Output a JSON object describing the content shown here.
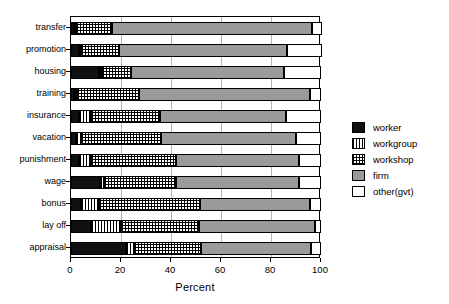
{
  "chart_data": {
    "type": "bar",
    "orientation": "horizontal",
    "stacked": true,
    "title": "",
    "xlabel": "Percent",
    "ylabel": "",
    "xlim": [
      0,
      100
    ],
    "xticks": [
      0,
      20,
      40,
      60,
      80,
      100
    ],
    "xtick_labels": [
      "0",
      "20",
      "40",
      "60",
      "80",
      "100"
    ],
    "grid": "vertical",
    "legend_position": "right",
    "categories": [
      "transfer",
      "promotion",
      "housing",
      "training",
      "insurance",
      "vacation",
      "punishment",
      "wage",
      "bonus",
      "lay off",
      "appraisal"
    ],
    "series": [
      {
        "name": "worker",
        "fill": "solid-black",
        "color": "#111111",
        "values": [
          1.2,
          3.0,
          11.0,
          1.0,
          3.0,
          2.0,
          3.0,
          11.5,
          4.0,
          8.0,
          22.0
        ]
      },
      {
        "name": "workgroup",
        "fill": "vertical-lines",
        "color": "#ffffff",
        "values": [
          0.5,
          0.5,
          1.5,
          1.5,
          5.0,
          2.0,
          5.0,
          1.5,
          7.0,
          12.0,
          3.0
        ]
      },
      {
        "name": "workshop",
        "fill": "crosshatch-grid",
        "color": "#ffffff",
        "values": [
          14.3,
          15.5,
          11.5,
          24.5,
          27.5,
          32.0,
          34.0,
          29.0,
          40.5,
          31.0,
          27.0
        ]
      },
      {
        "name": "firm",
        "fill": "solid-gray",
        "color": "#9a9a9a",
        "values": [
          80.0,
          67.0,
          61.0,
          68.5,
          50.5,
          54.0,
          49.0,
          49.0,
          44.0,
          46.5,
          44.0
        ]
      },
      {
        "name": "other(gvt)",
        "fill": "solid-white",
        "color": "#ffffff",
        "values": [
          4.0,
          14.0,
          15.0,
          4.5,
          14.0,
          10.0,
          9.0,
          9.0,
          4.5,
          2.5,
          4.0
        ]
      }
    ]
  },
  "legend": {
    "items": [
      {
        "label": "worker"
      },
      {
        "label": "workgroup"
      },
      {
        "label": "workshop"
      },
      {
        "label": "firm"
      },
      {
        "label": "other(gvt)"
      }
    ]
  }
}
